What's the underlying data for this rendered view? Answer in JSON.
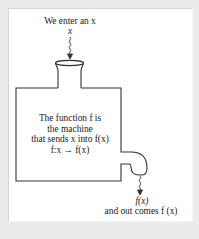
{
  "diagram": {
    "type": "function-machine",
    "input": {
      "caption": "We enter an x",
      "symbol": "x"
    },
    "machine": {
      "lines": [
        "The function f is",
        "the machine",
        "that sends x into f(x)",
        "f:x → f(x)"
      ]
    },
    "output": {
      "symbol": "f(x)",
      "caption": "and out comes f (x)"
    },
    "colors": {
      "background": "#ebebeb",
      "panel": "#ffffff",
      "stroke": "#333333",
      "text": "#222222"
    }
  }
}
